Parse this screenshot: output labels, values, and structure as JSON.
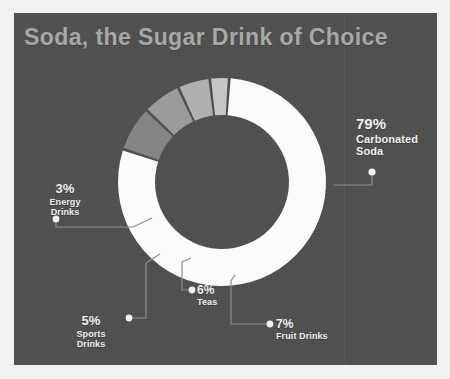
{
  "panel": {
    "background_color": "#4f4f4f",
    "page_background_color": "#f2f2f0"
  },
  "title": {
    "text": "Soda, the Sugar Drink of Choice",
    "color": "#a8a8a6"
  },
  "chart_data": {
    "type": "pie",
    "variant": "donut",
    "title": "Soda, the Sugar Drink of Choice",
    "xlabel": "",
    "ylabel": "",
    "units": "percent",
    "total": 100,
    "legend_position": "callouts",
    "grid": false,
    "categories": [
      "Carbonated Soda",
      "Fruit Drinks",
      "Teas",
      "Sports Drinks",
      "Energy Drinks"
    ],
    "values": [
      79,
      7,
      6,
      5,
      3
    ],
    "labels": [
      "79%",
      "7%",
      "6%",
      "5%",
      "3%"
    ],
    "colors": [
      "#fbfbf9",
      "#848482",
      "#9b9b98",
      "#b0b0ad",
      "#c6c6c3"
    ],
    "slices": [
      {
        "label": "Carbonated Soda",
        "value": 79,
        "display": "79%",
        "color": "#fbfbf9"
      },
      {
        "label": "Fruit Drinks",
        "value": 7,
        "display": "7%",
        "color": "#848482"
      },
      {
        "label": "Teas",
        "value": 6,
        "display": "6%",
        "color": "#9b9b98"
      },
      {
        "label": "Sports Drinks",
        "value": 5,
        "display": "5%",
        "color": "#b0b0ad"
      },
      {
        "label": "Energy Drinks",
        "value": 3,
        "display": "3%",
        "color": "#c6c6c3"
      }
    ]
  },
  "callouts": {
    "carbonated": {
      "pct": "79%",
      "line1": "Carbonated",
      "line2": "Soda"
    },
    "energy": {
      "pct": "3%",
      "line1": "Energy",
      "line2": "Drinks"
    },
    "sports": {
      "pct": "5%",
      "line1": "Sports",
      "line2": "Drinks"
    },
    "teas": {
      "pct": "6%",
      "line1": "Teas",
      "line2": ""
    },
    "fruit": {
      "pct": "7%",
      "line1": "Fruit Drinks",
      "line2": ""
    }
  }
}
